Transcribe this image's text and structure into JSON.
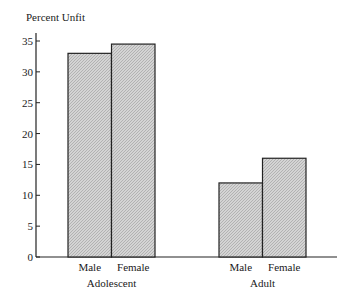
{
  "chart_data": {
    "type": "bar",
    "title": "",
    "ylabel": "Percent Unfit",
    "xlabel": "",
    "ylim": [
      0,
      35
    ],
    "yticks": [
      0,
      5,
      10,
      15,
      20,
      25,
      30,
      35
    ],
    "grid": false,
    "legend": null,
    "groups": [
      {
        "label": "Adolescent",
        "categories": [
          "Male",
          "Female"
        ],
        "values": [
          33,
          34.5
        ]
      },
      {
        "label": "Adult",
        "categories": [
          "Male",
          "Female"
        ],
        "values": [
          12,
          16
        ]
      }
    ],
    "categories": [
      "Adolescent Male",
      "Adolescent Female",
      "Adult Male",
      "Adult Female"
    ],
    "values": [
      33,
      34.5,
      12,
      16
    ],
    "bar_fill": "#c8c8c8",
    "bar_stroke": "#222222"
  }
}
